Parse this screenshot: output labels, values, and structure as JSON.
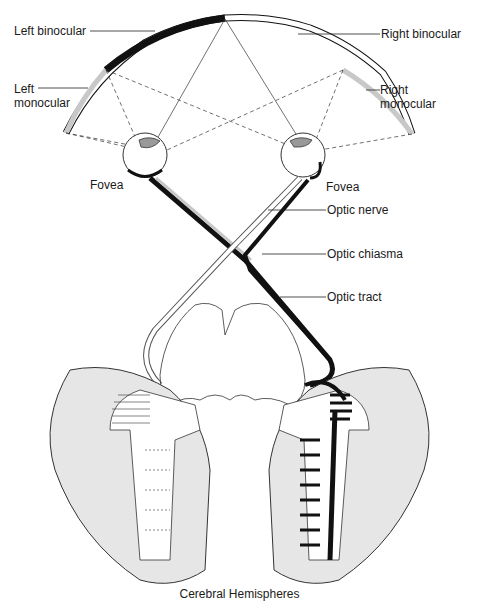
{
  "labels": {
    "left_binocular": "Left binocular",
    "right_binocular": "Right binocular",
    "left_monocular_1": "Left",
    "left_monocular_2": "monocular",
    "right_monocular_1": "Right",
    "right_monocular_2": "monocular",
    "fovea_left": "Fovea",
    "fovea_right": "Fovea",
    "optic_nerve": "Optic nerve",
    "optic_chiasma": "Optic chiasma",
    "optic_tract": "Optic tract"
  },
  "caption": "Cerebral Hemispheres",
  "colors": {
    "ink": "#111111",
    "gray_fill": "#c8c8c8",
    "cortex_fill": "#e6e6e6",
    "background": "#ffffff"
  }
}
